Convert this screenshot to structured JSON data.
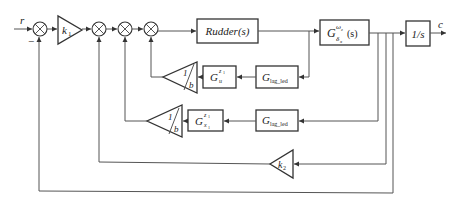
{
  "diagram": {
    "type": "control-system block diagram",
    "input_label": "r",
    "output_label": "c",
    "sum1_sign": "−",
    "k1": {
      "base": "k",
      "sub": "1"
    },
    "k2": {
      "base": "k",
      "sub": "2"
    },
    "rudder": "Rudder(s)",
    "plant": {
      "base": "G",
      "sup": "ω",
      "sup2": "z",
      "sub": "δ",
      "sub2": "x",
      "arg": "(s)"
    },
    "integrator": "1/s",
    "row2": {
      "lag": {
        "base": "G",
        "sub": "lag_led"
      },
      "filter": {
        "base": "G",
        "sup": "z",
        "sup_sub": "1",
        "sub": "u"
      },
      "gain": {
        "num": "1",
        "den": "b"
      }
    },
    "row3": {
      "lag": {
        "base": "G",
        "sub": "lag_led"
      },
      "filter": {
        "base": "G",
        "sup": "z",
        "sup_sub": "1",
        "sub": "x",
        "sub_sub": "1"
      },
      "gain": {
        "num": "1",
        "den": "b"
      }
    },
    "colors": {
      "line": "#555555",
      "block": "#333333",
      "text": "#222222"
    }
  }
}
